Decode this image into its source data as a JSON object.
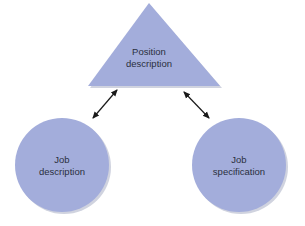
{
  "colors": {
    "shape_fill": "#a3addb",
    "shape_shadow": "#d0d3df",
    "arrow": "#1a1a1a",
    "text": "#2a2f3d",
    "background": "#ffffff"
  },
  "nodes": {
    "top": {
      "shape": "triangle",
      "line1": "Position",
      "line2": "description"
    },
    "left": {
      "shape": "circle",
      "line1": "Job",
      "line2": "description"
    },
    "right": {
      "shape": "circle",
      "line1": "Job",
      "line2": "specification"
    }
  },
  "edges": [
    {
      "from": "top",
      "to": "left",
      "type": "bidirectional-arrow"
    },
    {
      "from": "top",
      "to": "right",
      "type": "bidirectional-arrow"
    }
  ]
}
